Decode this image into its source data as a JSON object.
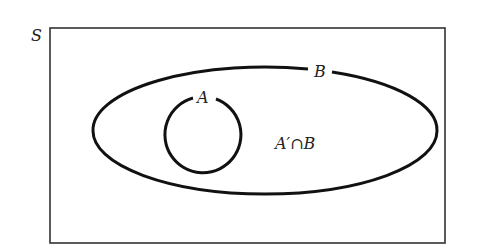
{
  "diagram": {
    "type": "venn",
    "universal_set": {
      "label": "S"
    },
    "sets": [
      {
        "id": "B",
        "label": "B",
        "shape": "ellipse"
      },
      {
        "id": "A",
        "label": "A",
        "shape": "circle",
        "subset_of": "B"
      }
    ],
    "region_labels": [
      {
        "label": "A′∩B",
        "region": "inside B, outside A"
      }
    ],
    "colors": {
      "stroke": "#111111",
      "frame": "#333333",
      "background": "#ffffff"
    }
  }
}
